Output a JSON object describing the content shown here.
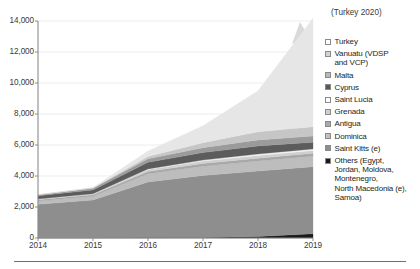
{
  "chart_data": {
    "type": "area",
    "stacked": true,
    "title": "",
    "xlabel": "",
    "ylabel": "",
    "x": [
      "2014",
      "2015",
      "2016",
      "2017",
      "2018",
      "2019"
    ],
    "categories": [
      "2014",
      "2015",
      "2016",
      "2017",
      "2018",
      "2019"
    ],
    "xtick_labels": [
      "2014",
      "2015",
      "2016",
      "2017",
      "2018",
      "2019"
    ],
    "ytick_labels": [
      "0",
      "2,000",
      "4,000",
      "6,000",
      "8,000",
      "10,000",
      "12,000",
      "14,000"
    ],
    "ytick_values": [
      0,
      2000,
      4000,
      6000,
      8000,
      10000,
      12000,
      14000
    ],
    "ylim": [
      0,
      14000
    ],
    "grid": true,
    "grid_axis": "y",
    "legend_position": "right",
    "annotations": [
      {
        "text": "(Turkey 2020)",
        "kind": "arrow-callout"
      }
    ],
    "stack_order_bottom_to_top": [
      "Others (Egypt, Jordan, Moldova, Montenegro, North Macedonia (e), Samoa)",
      "Saint Kitts (e)",
      "Dominica",
      "Antigua",
      "Grenada",
      "Saint Lucia",
      "Cyprus",
      "Malta",
      "Vanuatu (VDSP and VCP)",
      "Turkey"
    ],
    "series": [
      {
        "name": "Others (Egypt, Jordan, Moldova, Montenegro, North Macedonia (e), Samoa)",
        "color": "#1a1a1a",
        "values": [
          15,
          18,
          25,
          40,
          90,
          270
        ]
      },
      {
        "name": "Saint Kitts (e)",
        "color": "#8e8e8e",
        "values": [
          2160,
          2430,
          3590,
          3990,
          4230,
          4330
        ]
      },
      {
        "name": "Dominica",
        "color": "#bdbdbd",
        "values": [
          210,
          240,
          530,
          600,
          650,
          680
        ]
      },
      {
        "name": "Antigua",
        "color": "#a8a8a8",
        "values": [
          90,
          100,
          150,
          170,
          180,
          185
        ]
      },
      {
        "name": "Grenada",
        "color": "#cfcfcf",
        "values": [
          40,
          55,
          120,
          160,
          175,
          180
        ]
      },
      {
        "name": "Saint Lucia",
        "color": "#f2f2f2",
        "values": [
          0,
          10,
          40,
          70,
          95,
          105
        ]
      },
      {
        "name": "Cyprus",
        "color": "#5c5c5c",
        "values": [
          210,
          250,
          430,
          480,
          520,
          430
        ]
      },
      {
        "name": "Malta",
        "color": "#9b9b9b",
        "values": [
          60,
          110,
          220,
          310,
          390,
          400
        ]
      },
      {
        "name": "Vanuatu (VDSP and VCP)",
        "color": "#c6c6c6",
        "values": [
          0,
          20,
          160,
          330,
          520,
          600
        ]
      },
      {
        "name": "Turkey",
        "color": "#e6e6e6",
        "values": [
          0,
          30,
          340,
          1100,
          2650,
          7000
        ]
      }
    ],
    "totals": [
      2785,
      3263,
      5605,
      7250,
      9500,
      14180
    ]
  },
  "legend": {
    "items": [
      {
        "label": "Turkey",
        "color": "#ffffff"
      },
      {
        "label": "Vanuatu (VDSP\nand VCP)",
        "color": "#d4d4d4"
      },
      {
        "label": "Malta",
        "color": "#b8b8b8"
      },
      {
        "label": "Cyprus",
        "color": "#585858"
      },
      {
        "label": "Saint Lucia",
        "color": "#fbfbfb"
      },
      {
        "label": "Grenada",
        "color": "#d0d0d0"
      },
      {
        "label": "Antigua",
        "color": "#a9a9a9"
      },
      {
        "label": "Dominica",
        "color": "#c0c0c0"
      },
      {
        "label": "Saint Kitts (e)",
        "color": "#8e8e8e"
      },
      {
        "label": "Others (Egypt,\nJordan, Moldova,\nMontenegro,\nNorth Macedonia (e),\nSamoa)",
        "color": "#1a1a1a"
      }
    ]
  },
  "annotation": {
    "text": "(Turkey 2020)"
  },
  "axis": {
    "y_labels": [
      "14,000",
      "12,000",
      "10,000",
      "8,000",
      "6,000",
      "4,000",
      "2,000",
      "0"
    ],
    "x_labels": [
      "2014",
      "2015",
      "2016",
      "2017",
      "2018",
      "2019"
    ]
  },
  "colors": {
    "axis": "#8c8c8c",
    "grid": "#ededed",
    "text": "#231f20",
    "rule": "#6f6f6f",
    "arrow": "#d9d9d9"
  }
}
